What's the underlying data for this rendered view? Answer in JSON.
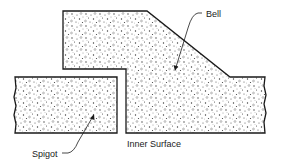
{
  "diagram": {
    "type": "cross-section",
    "labels": {
      "bell": "Bell",
      "spigot": "Spigot",
      "inner_surface": "Inner Surface"
    },
    "parts": [
      {
        "id": "bell",
        "label": "Bell",
        "fill": "concrete stipple"
      },
      {
        "id": "spigot",
        "label": "Spigot",
        "fill": "concrete stipple"
      }
    ],
    "colors": {
      "outline": "#1a1a1a",
      "background": "#ffffff",
      "stipple": "#3a3a3a"
    }
  }
}
